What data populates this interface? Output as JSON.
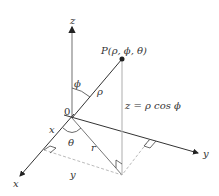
{
  "diagram": {
    "type": "spherical-coordinates",
    "labels": {
      "z_axis": "z",
      "x_axis": "x",
      "y_axis": "y",
      "origin": "0",
      "point": "P(ρ, ϕ, θ)",
      "phi": "ϕ",
      "rho": "ρ",
      "theta": "θ",
      "r": "r",
      "x_component": "x",
      "y_component": "y",
      "z_formula": "z = ρ cos ϕ"
    },
    "colors": {
      "axis": "#222222",
      "guide": "#bbbbbb",
      "point": "#222222"
    }
  }
}
